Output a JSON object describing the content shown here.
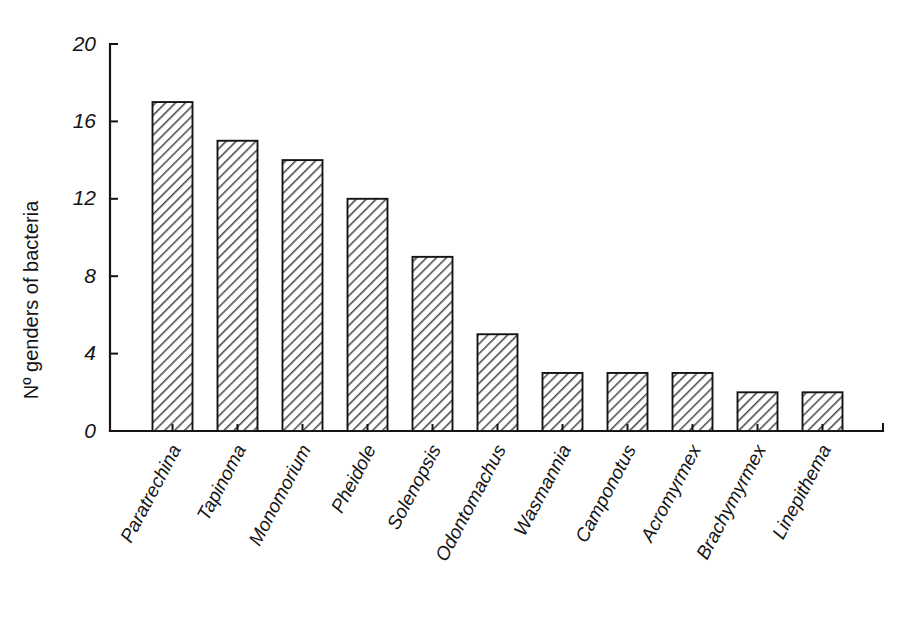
{
  "chart_data": {
    "type": "bar",
    "title": "",
    "subtitle": "",
    "xlabel": "",
    "ylabel": "Nº genders of bacteria",
    "categories": [
      "Paratrechina",
      "Tapinoma",
      "Monomorium",
      "Pheidole",
      "Solenopsis",
      "Odontomachus",
      "Wasmannia",
      "Camponotus",
      "Acromyrmex",
      "Brachymyrmex",
      "Linepithema"
    ],
    "values": [
      17,
      15,
      14,
      12,
      9,
      5,
      3,
      3,
      3,
      2,
      2
    ],
    "ylim": [
      0,
      20
    ],
    "yticks": [
      0,
      4,
      8,
      12,
      16,
      20
    ],
    "ytick_labels": [
      "0",
      "4",
      "8",
      "12",
      "16",
      "20"
    ],
    "grid": false,
    "legend": null,
    "legend_position": "none",
    "bar_style": {
      "fill": "#ffffff",
      "edge_color": "#141414",
      "hatch": "diagonal-45-forward",
      "hatch_color": "#3a3a3a"
    },
    "axis_color": "#141414",
    "background_color": "#ffffff",
    "category_label_rotation": 62,
    "category_label_style": "italic"
  }
}
